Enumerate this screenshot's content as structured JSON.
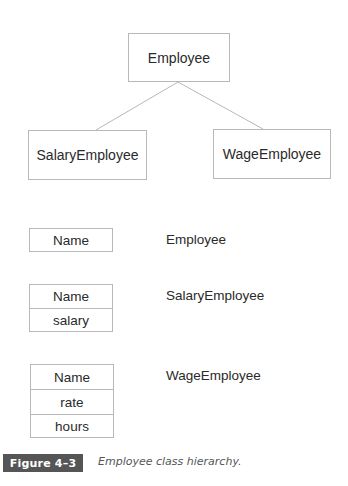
{
  "hierarchy": {
    "root": "Employee",
    "children": [
      "SalaryEmployee",
      "WageEmployee"
    ]
  },
  "records": [
    {
      "class": "Employee",
      "fields": [
        "Name"
      ]
    },
    {
      "class": "SalaryEmployee",
      "fields": [
        "Name",
        "salary"
      ]
    },
    {
      "class": "WageEmployee",
      "fields": [
        "Name",
        "rate",
        "hours"
      ]
    }
  ],
  "figure": {
    "label": "Figure 4–3",
    "caption": "Employee class hierarchy."
  }
}
